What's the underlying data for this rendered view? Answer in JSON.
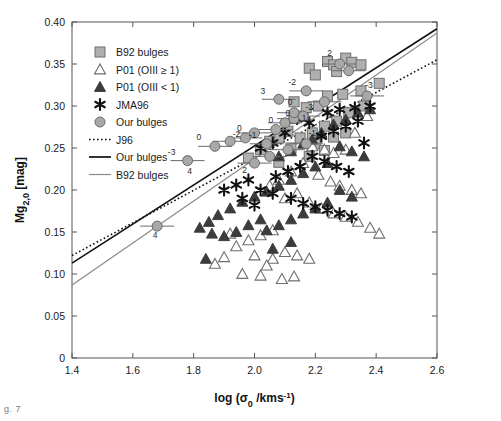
{
  "figure": {
    "caption_fragment": "g. 7"
  },
  "chart_data": {
    "type": "scatter",
    "title": "",
    "xlabel": "log (σ₀ / kms⁻¹)",
    "ylabel": "Mg₂,₀ [mag]",
    "xlim": [
      1.4,
      2.6
    ],
    "ylim": [
      0.0,
      0.4
    ],
    "xticks": [
      1.4,
      1.6,
      1.8,
      2.0,
      2.2,
      2.4,
      2.6
    ],
    "xticklabels": [
      "1.4",
      "1.6",
      "1.8",
      "2.0",
      "2.2",
      "2.4",
      "2.6"
    ],
    "yticks": [
      0,
      0.05,
      0.1,
      0.15,
      0.2,
      0.25,
      0.3,
      0.35,
      0.4
    ],
    "yticklabels": [
      "0",
      "0.05",
      "0.10",
      "0.15",
      "0.20",
      "0.25",
      "0.30",
      "0.35",
      "0.40"
    ],
    "grid": false,
    "legend_position": "upper-left",
    "colors": {
      "square_fill": "#b0b0b0",
      "square_edge": "#6e6e6e",
      "open_tri_edge": "#6e6e6e",
      "filled_tri": "#3c3c3c",
      "star": "#111111",
      "circle_fill": "#a8a8a8",
      "circle_edge": "#6a6a6a",
      "line_dotted": "#111111",
      "line_our": "#111111",
      "line_b92": "#8a8a8a",
      "axis": "#555555"
    },
    "legend": [
      {
        "label": "B92 bulges",
        "marker": "square"
      },
      {
        "label": "P01 (OIII ≥ 1)",
        "marker": "open-triangle"
      },
      {
        "label": "P01 (OIII < 1)",
        "marker": "filled-triangle"
      },
      {
        "label": "JMA96",
        "marker": "star"
      },
      {
        "label": "Our bulges",
        "marker": "circle"
      },
      {
        "label": "J96",
        "marker": "dotted-line"
      },
      {
        "label": "Our bulges",
        "marker": "solid-line"
      },
      {
        "label": "B92 bulges",
        "marker": "thin-line"
      }
    ],
    "lines": [
      {
        "name": "J96",
        "style": "dotted",
        "x": [
          1.4,
          2.6
        ],
        "y": [
          0.122,
          0.355
        ]
      },
      {
        "name": "Our bulges",
        "style": "solid",
        "x": [
          1.4,
          2.6
        ],
        "y": [
          0.113,
          0.392
        ]
      },
      {
        "name": "B92 bulges",
        "style": "thin",
        "x": [
          1.4,
          2.6
        ],
        "y": [
          0.087,
          0.387
        ]
      }
    ],
    "series": [
      {
        "name": "B92 bulges",
        "marker": "square",
        "points": [
          [
            2.13,
            0.305
          ],
          [
            2.16,
            0.288
          ],
          [
            2.18,
            0.345
          ],
          [
            2.2,
            0.337
          ],
          [
            2.24,
            0.353
          ],
          [
            2.26,
            0.349
          ],
          [
            2.27,
            0.341
          ],
          [
            2.3,
            0.357
          ],
          [
            2.32,
            0.352
          ],
          [
            2.35,
            0.349
          ],
          [
            2.41,
            0.327
          ],
          [
            2.35,
            0.318
          ],
          [
            2.29,
            0.314
          ],
          [
            2.24,
            0.312
          ],
          [
            2.21,
            0.3
          ],
          [
            2.17,
            0.298
          ],
          [
            2.13,
            0.285
          ],
          [
            2.11,
            0.27
          ],
          [
            2.08,
            0.262
          ],
          [
            2.05,
            0.258
          ],
          [
            2.15,
            0.262
          ],
          [
            2.19,
            0.268
          ],
          [
            2.23,
            0.276
          ],
          [
            2.27,
            0.282
          ],
          [
            2.31,
            0.292
          ],
          [
            2.26,
            0.263
          ],
          [
            2.2,
            0.255
          ],
          [
            2.12,
            0.25
          ],
          [
            2.02,
            0.248
          ],
          [
            1.98,
            0.238
          ],
          [
            2.23,
            0.247
          ],
          [
            2.08,
            0.233
          ],
          [
            2.18,
            0.24
          ],
          [
            2.3,
            0.268
          ],
          [
            2.36,
            0.3
          ]
        ]
      },
      {
        "name": "P01 (OIII ≥ 1)",
        "marker": "open-triangle",
        "points": [
          [
            2.19,
            0.252
          ],
          [
            2.23,
            0.248
          ],
          [
            2.26,
            0.244
          ],
          [
            2.3,
            0.248
          ],
          [
            2.33,
            0.268
          ],
          [
            2.37,
            0.288
          ],
          [
            2.16,
            0.232
          ],
          [
            2.12,
            0.222
          ],
          [
            2.08,
            0.212
          ],
          [
            2.05,
            0.205
          ],
          [
            2.21,
            0.218
          ],
          [
            2.25,
            0.21
          ],
          [
            2.28,
            0.205
          ],
          [
            2.32,
            0.2
          ],
          [
            2.35,
            0.196
          ],
          [
            2.14,
            0.196
          ],
          [
            2.1,
            0.19
          ],
          [
            2.18,
            0.185
          ],
          [
            2.22,
            0.178
          ],
          [
            2.26,
            0.172
          ],
          [
            2.3,
            0.168
          ],
          [
            2.34,
            0.162
          ],
          [
            2.06,
            0.152
          ],
          [
            2.02,
            0.146
          ],
          [
            1.98,
            0.14
          ],
          [
            1.94,
            0.133
          ],
          [
            1.9,
            0.12
          ],
          [
            1.87,
            0.112
          ],
          [
            2.1,
            0.126
          ],
          [
            2.14,
            0.122
          ],
          [
            2.18,
            0.118
          ],
          [
            2.06,
            0.118
          ],
          [
            1.96,
            0.1
          ],
          [
            2.02,
            0.098
          ],
          [
            2.09,
            0.094
          ],
          [
            2.13,
            0.097
          ],
          [
            2.04,
            0.11
          ],
          [
            2.0,
            0.122
          ],
          [
            1.92,
            0.148
          ],
          [
            2.38,
            0.155
          ],
          [
            2.41,
            0.148
          ]
        ]
      },
      {
        "name": "P01 (OIII < 1)",
        "marker": "filled-triangle",
        "points": [
          [
            2.34,
            0.292
          ],
          [
            2.38,
            0.296
          ],
          [
            2.3,
            0.284
          ],
          [
            2.26,
            0.278
          ],
          [
            2.22,
            0.268
          ],
          [
            2.19,
            0.26
          ],
          [
            2.16,
            0.255
          ],
          [
            2.12,
            0.246
          ],
          [
            2.08,
            0.24
          ],
          [
            2.28,
            0.252
          ],
          [
            2.32,
            0.246
          ],
          [
            2.36,
            0.24
          ],
          [
            2.24,
            0.232
          ],
          [
            2.2,
            0.228
          ],
          [
            2.16,
            0.22
          ],
          [
            2.12,
            0.212
          ],
          [
            2.08,
            0.205
          ],
          [
            2.04,
            0.198
          ],
          [
            2.0,
            0.192
          ],
          [
            1.96,
            0.186
          ],
          [
            1.92,
            0.178
          ],
          [
            1.88,
            0.17
          ],
          [
            1.85,
            0.162
          ],
          [
            1.82,
            0.155
          ],
          [
            1.86,
            0.148
          ],
          [
            1.9,
            0.145
          ],
          [
            1.94,
            0.15
          ],
          [
            1.98,
            0.158
          ],
          [
            2.02,
            0.165
          ],
          [
            1.84,
            0.118
          ],
          [
            2.04,
            0.152
          ],
          [
            2.28,
            0.2
          ],
          [
            2.32,
            0.192
          ],
          [
            2.24,
            0.185
          ],
          [
            2.2,
            0.178
          ],
          [
            2.16,
            0.172
          ],
          [
            2.12,
            0.165
          ],
          [
            2.08,
            0.158
          ],
          [
            2.12,
            0.138
          ],
          [
            2.06,
            0.13
          ]
        ]
      },
      {
        "name": "JMA96",
        "marker": "star",
        "points": [
          [
            2.14,
            0.285
          ],
          [
            2.18,
            0.28
          ],
          [
            2.24,
            0.292
          ],
          [
            2.28,
            0.296
          ],
          [
            2.33,
            0.298
          ],
          [
            2.38,
            0.3
          ],
          [
            2.34,
            0.282
          ],
          [
            2.3,
            0.276
          ],
          [
            2.26,
            0.27
          ],
          [
            2.22,
            0.264
          ],
          [
            2.1,
            0.268
          ],
          [
            2.06,
            0.256
          ],
          [
            2.02,
            0.25
          ],
          [
            2.19,
            0.24
          ],
          [
            2.23,
            0.234
          ],
          [
            2.27,
            0.228
          ],
          [
            2.31,
            0.222
          ],
          [
            2.15,
            0.228
          ],
          [
            2.11,
            0.222
          ],
          [
            2.07,
            0.216
          ],
          [
            1.98,
            0.212
          ],
          [
            1.94,
            0.206
          ],
          [
            1.9,
            0.2
          ],
          [
            2.02,
            0.2
          ],
          [
            2.06,
            0.196
          ],
          [
            2.12,
            0.19
          ],
          [
            2.16,
            0.184
          ],
          [
            2.2,
            0.18
          ],
          [
            2.24,
            0.176
          ],
          [
            2.28,
            0.172
          ],
          [
            2.32,
            0.168
          ],
          [
            1.96,
            0.19
          ],
          [
            2.0,
            0.182
          ],
          [
            2.36,
            0.256
          ]
        ]
      },
      {
        "name": "Our bulges",
        "marker": "circle",
        "errorbars": true,
        "points": [
          [
            1.68,
            0.157
          ],
          [
            1.78,
            0.235
          ],
          [
            1.87,
            0.252
          ],
          [
            1.92,
            0.258
          ],
          [
            1.97,
            0.262
          ],
          [
            2.0,
            0.268
          ],
          [
            2.04,
            0.255
          ],
          [
            2.07,
            0.272
          ],
          [
            2.1,
            0.28
          ],
          [
            2.13,
            0.285
          ],
          [
            2.13,
            0.292
          ],
          [
            2.16,
            0.288
          ],
          [
            2.08,
            0.308
          ],
          [
            2.17,
            0.318
          ],
          [
            2.23,
            0.305
          ],
          [
            2.28,
            0.35
          ],
          [
            2.31,
            0.342
          ],
          [
            2.37,
            0.312
          ],
          [
            2.11,
            0.248
          ],
          [
            2.17,
            0.255
          ],
          [
            2.05,
            0.24
          ],
          [
            2.0,
            0.232
          ]
        ],
        "point_labels": [
          {
            "x": 1.68,
            "y": 0.157,
            "text": "4",
            "dx": -2,
            "dy": 12
          },
          {
            "x": 1.78,
            "y": 0.235,
            "text": "-3",
            "dx": -16,
            "dy": -6
          },
          {
            "x": 1.78,
            "y": 0.235,
            "text": "4",
            "dx": 2,
            "dy": 13
          },
          {
            "x": 1.87,
            "y": 0.252,
            "text": "0",
            "dx": -16,
            "dy": -6
          },
          {
            "x": 1.97,
            "y": 0.262,
            "text": "0",
            "dx": -6,
            "dy": -7
          },
          {
            "x": 2.0,
            "y": 0.268,
            "text": "-2",
            "dx": -18,
            "dy": 4
          },
          {
            "x": 2.07,
            "y": 0.272,
            "text": "0",
            "dx": -5,
            "dy": -7
          },
          {
            "x": 2.1,
            "y": 0.28,
            "text": "0",
            "dx": 3,
            "dy": -7
          },
          {
            "x": 2.13,
            "y": 0.292,
            "text": "0",
            "dx": -4,
            "dy": -8
          },
          {
            "x": 2.16,
            "y": 0.288,
            "text": "-2",
            "dx": 6,
            "dy": -6
          },
          {
            "x": 2.17,
            "y": 0.318,
            "text": "-2",
            "dx": -14,
            "dy": -6
          },
          {
            "x": 2.08,
            "y": 0.308,
            "text": "3",
            "dx": -16,
            "dy": -5
          },
          {
            "x": 2.28,
            "y": 0.35,
            "text": "2",
            "dx": -10,
            "dy": -8
          },
          {
            "x": 2.37,
            "y": 0.312,
            "text": "-3",
            "dx": 2,
            "dy": -8
          },
          {
            "x": 2.13,
            "y": 0.285,
            "text": "1",
            "dx": 10,
            "dy": 2
          },
          {
            "x": 2.11,
            "y": 0.248,
            "text": "2",
            "dx": -8,
            "dy": 10
          },
          {
            "x": 2.17,
            "y": 0.255,
            "text": "-1",
            "dx": 6,
            "dy": -8
          },
          {
            "x": 2.04,
            "y": 0.255,
            "text": "-1",
            "dx": -14,
            "dy": -6
          },
          {
            "x": 2.0,
            "y": 0.232,
            "text": "2",
            "dx": -10,
            "dy": 10
          }
        ]
      }
    ]
  }
}
